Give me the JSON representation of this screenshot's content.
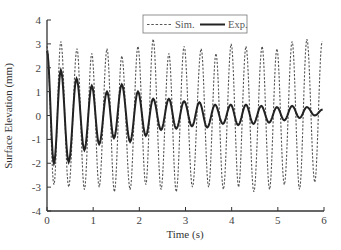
{
  "chart_data": {
    "type": "line",
    "title": "",
    "xlabel": "Time (s)",
    "ylabel": "Surface Elevation (mm)",
    "xlim": [
      0,
      6
    ],
    "ylim": [
      -4,
      4
    ],
    "xticks": [
      0,
      1,
      2,
      3,
      4,
      5,
      6
    ],
    "yticks": [
      -4,
      -3,
      -2,
      -1,
      0,
      1,
      2,
      3,
      4
    ],
    "grid": false,
    "legend_position": "top-center",
    "representation": "extrema points (time s, elevation mm) joined by sinusoidal segments",
    "series": [
      {
        "name": "Sim.",
        "style": "dashed",
        "color": "#555555",
        "points": [
          [
            0.0,
            2.9
          ],
          [
            0.15,
            -2.9
          ],
          [
            0.3,
            3.1
          ],
          [
            0.47,
            -3.0
          ],
          [
            0.65,
            2.8
          ],
          [
            0.81,
            -3.1
          ],
          [
            0.97,
            2.6
          ],
          [
            1.13,
            -3.0
          ],
          [
            1.3,
            2.8
          ],
          [
            1.46,
            -3.2
          ],
          [
            1.62,
            2.5
          ],
          [
            1.8,
            -3.1
          ],
          [
            1.97,
            2.9
          ],
          [
            2.14,
            -2.9
          ],
          [
            2.3,
            3.2
          ],
          [
            2.47,
            -3.1
          ],
          [
            2.64,
            2.6
          ],
          [
            2.8,
            -3.2
          ],
          [
            2.97,
            2.9
          ],
          [
            3.15,
            -3.0
          ],
          [
            3.34,
            2.8
          ],
          [
            3.5,
            -3.0
          ],
          [
            3.66,
            2.6
          ],
          [
            3.82,
            -3.1
          ],
          [
            3.99,
            3.0
          ],
          [
            4.15,
            -3.0
          ],
          [
            4.31,
            2.9
          ],
          [
            4.48,
            -3.2
          ],
          [
            4.66,
            2.9
          ],
          [
            4.82,
            -3.1
          ],
          [
            4.98,
            2.8
          ],
          [
            5.14,
            -2.9
          ],
          [
            5.31,
            3.1
          ],
          [
            5.47,
            -3.1
          ],
          [
            5.63,
            3.2
          ],
          [
            5.8,
            -2.8
          ],
          [
            5.96,
            3.1
          ]
        ]
      },
      {
        "name": "Exp.",
        "style": "solid",
        "color": "#222222",
        "points": [
          [
            0.0,
            2.7
          ],
          [
            0.15,
            -2.0
          ],
          [
            0.3,
            1.9
          ],
          [
            0.47,
            -1.95
          ],
          [
            0.64,
            1.55
          ],
          [
            0.81,
            -1.45
          ],
          [
            0.97,
            1.25
          ],
          [
            1.13,
            -1.2
          ],
          [
            1.3,
            1.0
          ],
          [
            1.45,
            -0.95
          ],
          [
            1.62,
            1.3
          ],
          [
            1.8,
            -1.1
          ],
          [
            1.97,
            1.0
          ],
          [
            2.14,
            -0.85
          ],
          [
            2.3,
            0.7
          ],
          [
            2.47,
            -0.6
          ],
          [
            2.64,
            0.7
          ],
          [
            2.8,
            -0.55
          ],
          [
            2.97,
            0.6
          ],
          [
            3.14,
            -0.45
          ],
          [
            3.3,
            0.55
          ],
          [
            3.47,
            -0.5
          ],
          [
            3.64,
            0.45
          ],
          [
            3.81,
            -0.35
          ],
          [
            3.98,
            0.45
          ],
          [
            4.14,
            -0.4
          ],
          [
            4.31,
            0.45
          ],
          [
            4.47,
            -0.35
          ],
          [
            4.64,
            0.4
          ],
          [
            4.81,
            -0.3
          ],
          [
            4.98,
            0.35
          ],
          [
            5.14,
            -0.2
          ],
          [
            5.31,
            0.4
          ],
          [
            5.47,
            -0.1
          ],
          [
            5.63,
            0.35
          ],
          [
            5.8,
            0.0
          ],
          [
            5.97,
            0.25
          ]
        ]
      }
    ]
  },
  "labels": {
    "xlabel": "Time (s)",
    "ylabel": "Surface Elevation (mm)",
    "legend": [
      "Sim.",
      "Exp."
    ]
  }
}
